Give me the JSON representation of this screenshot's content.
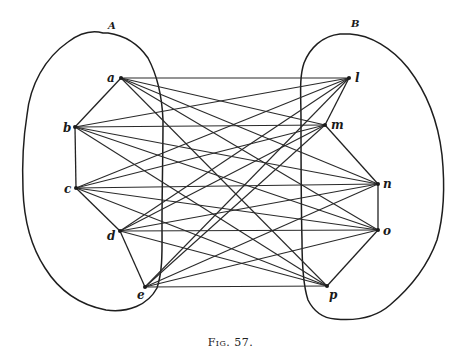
{
  "figure": {
    "caption": "Fig. 57.",
    "regions": [
      {
        "id": "A",
        "label": "A",
        "label_pos": [
          108,
          27
        ]
      },
      {
        "id": "B",
        "label": "B",
        "label_pos": [
          351,
          25
        ]
      }
    ],
    "nodes": [
      {
        "id": "a",
        "label": "a",
        "x": 121,
        "y": 78,
        "label_dx": -14,
        "label_dy": 4,
        "region": "A"
      },
      {
        "id": "b",
        "label": "b",
        "x": 75,
        "y": 127,
        "label_dx": -12,
        "label_dy": 5,
        "region": "A"
      },
      {
        "id": "c",
        "label": "c",
        "x": 76,
        "y": 188,
        "label_dx": -12,
        "label_dy": 5,
        "region": "A"
      },
      {
        "id": "d",
        "label": "d",
        "x": 120,
        "y": 231,
        "label_dx": -13,
        "label_dy": 9,
        "region": "A"
      },
      {
        "id": "e",
        "label": "e",
        "x": 145,
        "y": 287,
        "label_dx": -8,
        "label_dy": 12,
        "region": "A"
      },
      {
        "id": "l",
        "label": "l",
        "x": 349,
        "y": 78,
        "label_dx": 6,
        "label_dy": 4,
        "region": "B"
      },
      {
        "id": "m",
        "label": "m",
        "x": 325,
        "y": 125,
        "label_dx": 6,
        "label_dy": 4,
        "region": "B"
      },
      {
        "id": "n",
        "label": "n",
        "x": 378,
        "y": 184,
        "label_dx": 5,
        "label_dy": 4,
        "region": "B"
      },
      {
        "id": "o",
        "label": "o",
        "x": 378,
        "y": 230,
        "label_dx": 5,
        "label_dy": 5,
        "region": "B"
      },
      {
        "id": "p",
        "label": "p",
        "x": 327,
        "y": 286,
        "label_dx": 2,
        "label_dy": 13,
        "region": "B"
      }
    ],
    "chain_edges": [
      [
        "a",
        "b"
      ],
      [
        "b",
        "c"
      ],
      [
        "c",
        "d"
      ],
      [
        "d",
        "e"
      ],
      [
        "l",
        "m"
      ],
      [
        "m",
        "n"
      ],
      [
        "n",
        "o"
      ],
      [
        "o",
        "p"
      ]
    ],
    "bipartite_left": [
      "a",
      "b",
      "c",
      "d",
      "e"
    ],
    "bipartite_right": [
      "l",
      "m",
      "n",
      "o",
      "p"
    ],
    "edge_description": "Every node in region A is joined to every node in region B (complete bipartite K5,5)"
  }
}
